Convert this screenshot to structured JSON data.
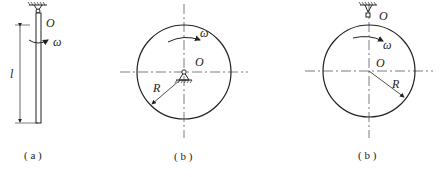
{
  "figures": [
    {
      "id": "a",
      "caption": "( a )",
      "labels": {
        "pivot": "O",
        "angular_velocity": "ω",
        "length": "l"
      }
    },
    {
      "id": "b1",
      "caption": "( b )",
      "labels": {
        "pivot": "O",
        "angular_velocity": "ω",
        "radius": "R"
      }
    },
    {
      "id": "b2",
      "caption": "( b )",
      "labels": {
        "pivot_top": "O",
        "center": "O",
        "angular_velocity": "ω",
        "radius": "R"
      }
    }
  ],
  "colors": {
    "stroke": "#222222",
    "background": "#ffffff"
  }
}
